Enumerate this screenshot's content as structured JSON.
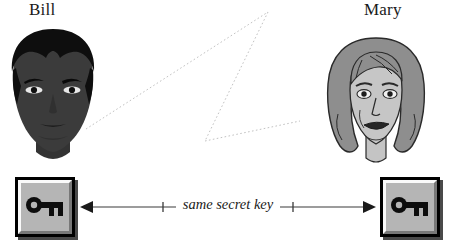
{
  "diagram": {
    "background_color": "#ffffff"
  },
  "people": [
    {
      "id": "bill",
      "label": "Bill",
      "portrait_style": "dark-silhouette-portrait",
      "icon_name": "bill-portrait"
    },
    {
      "id": "mary",
      "label": "Mary",
      "portrait_style": "line-art-portrait",
      "icon_name": "mary-portrait"
    }
  ],
  "keys": [
    {
      "id": "key-left",
      "icon_name": "key-icon",
      "button_label": ""
    },
    {
      "id": "key-right",
      "icon_name": "key-icon",
      "button_label": ""
    }
  ],
  "connection": {
    "caption": "same secret key",
    "bracket_left": "█",
    "bracket_right": "█",
    "arrow_left_icon": "arrow-left-icon",
    "arrow_right_icon": "arrow-right-icon",
    "line_style": "solid"
  },
  "sight_lines": {
    "style": "dotted",
    "color": "#bdbdbd",
    "description": "dotted sight lines between Bill and Mary"
  },
  "colors": {
    "ink": "#1a1a1a",
    "key_face": "#b5b5b5",
    "key_shadow": "#4a4a4a",
    "key_highlight": "#fafafa",
    "dotted_line": "#bdbdbd",
    "bill_skin": "#3a3a3a",
    "bill_hair": "#111111",
    "mary_hair": "#8c8c8c",
    "mary_skin": "#bfbfbf"
  }
}
